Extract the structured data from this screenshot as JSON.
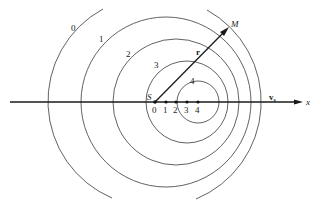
{
  "diagram": {
    "axis": {
      "label": "x",
      "y": 102,
      "x_start": 10,
      "x_end": 302
    },
    "source": {
      "label": "S",
      "positions": [
        {
          "label": "0",
          "x": 155
        },
        {
          "label": "1",
          "x": 166
        },
        {
          "label": "2",
          "x": 176
        },
        {
          "label": "3",
          "x": 187
        },
        {
          "label": "4",
          "x": 198
        }
      ]
    },
    "velocity_label": "v",
    "velocity_subscript": "s",
    "wavefronts": [
      {
        "label": "0",
        "cx": 155,
        "r": 105,
        "label_x": 72,
        "label_y": 31
      },
      {
        "label": "1",
        "cx": 166,
        "r": 85,
        "label_x": 100,
        "label_y": 42
      },
      {
        "label": "2",
        "cx": 176,
        "r": 63,
        "label_x": 127,
        "label_y": 57
      },
      {
        "label": "3",
        "cx": 187,
        "r": 41,
        "label_x": 155,
        "label_y": 68
      },
      {
        "label": "4",
        "cx": 198,
        "r": 21,
        "label_x": 191,
        "label_y": 84
      }
    ],
    "observer": {
      "label": "M",
      "x": 228,
      "y": 28
    },
    "distance_label": "r"
  }
}
